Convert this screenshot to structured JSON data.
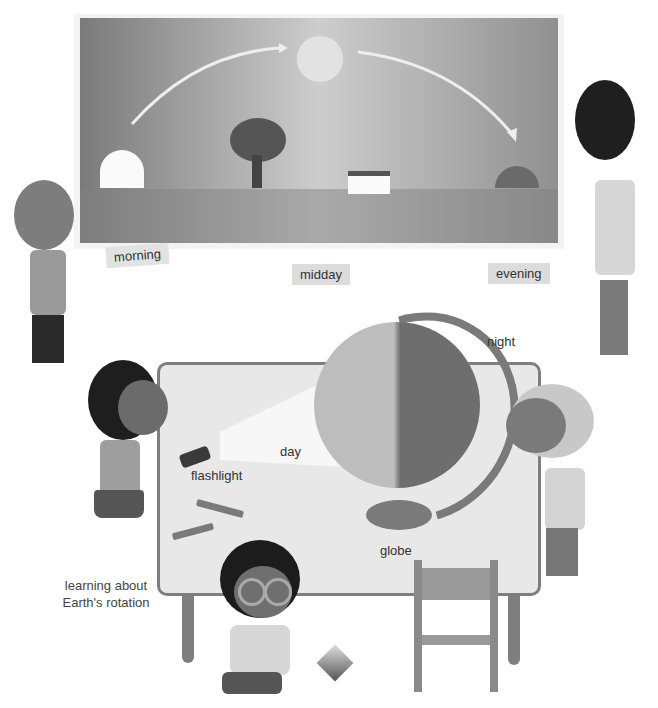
{
  "scene": {
    "poster": {
      "labels": {
        "morning": "morning",
        "midday": "midday",
        "evening": "evening"
      },
      "elements": [
        "rising-sun",
        "midday-sun",
        "setting-sun",
        "arc-arrow",
        "tree",
        "house"
      ]
    },
    "table_scene": {
      "labels": {
        "night": "night",
        "day": "day",
        "flashlight": "flashlight",
        "globe": "globe"
      }
    },
    "caption": {
      "line1": "learning about",
      "line2": "Earth's rotation"
    }
  },
  "colors": {
    "sky_left": "#7a7a7a",
    "sky_mid": "#c9c9c9",
    "sky_right": "#8e8e8e",
    "ground": "#8a8a8a",
    "table_top": "#e6e6e6",
    "table_edge": "#7e7e7e",
    "globe_day": "#b9b9b9",
    "globe_night": "#6e6e6e",
    "label_bg": "#dcdcdc"
  }
}
